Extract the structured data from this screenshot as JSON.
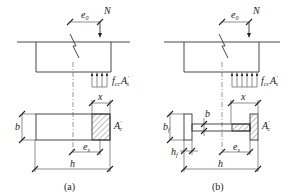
{
  "diagram": {
    "panels": [
      {
        "caption": "(a)",
        "section": "rectangular",
        "labels": {
          "eccentricity": "e",
          "eccentricity_sub": "0",
          "axial_force": "N",
          "stress_resultant": "f",
          "stress_resultant_sub": "cc",
          "stress_area": "A",
          "stress_area_sub": "s",
          "compression_depth": "x",
          "width": "b",
          "height": "h",
          "distance": "e",
          "distance_sub": "s",
          "compression_area": "A",
          "compression_area_sub": "c"
        }
      },
      {
        "caption": "(b)",
        "section": "I-section",
        "labels": {
          "eccentricity": "e",
          "eccentricity_sub": "0",
          "axial_force": "N",
          "stress_resultant": "f",
          "stress_resultant_sub": "cc",
          "stress_area": "A",
          "stress_area_sub": "s",
          "compression_depth": "x",
          "flange_width": "b",
          "flange_width_sub": "f",
          "web_thickness": "b",
          "flange_thickness": "h",
          "flange_thickness_sub": "f",
          "height": "h",
          "distance": "e",
          "distance_sub": "s",
          "compression_area": "A",
          "compression_area_sub": "c"
        }
      }
    ],
    "prime": "′"
  }
}
